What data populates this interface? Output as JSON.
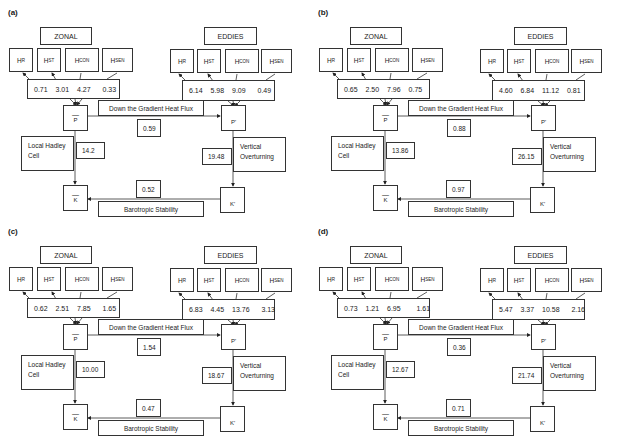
{
  "labels": {
    "zonal": "ZONAL",
    "eddies": "EDDIES",
    "h": "H",
    "h_subscripts": [
      "R",
      "ST",
      "CON",
      "SEN"
    ],
    "p_bar": "P",
    "k_bar": "K",
    "p_prime": "P'",
    "k_prime": "K'",
    "bar": "—",
    "gradient_flux": "Down the Gradient Heat Flux",
    "hadley_line1": "Local Hadley",
    "hadley_line2": "Cell",
    "vertical_line1": "Vertical",
    "vertical_line2": "Overturning",
    "barotropic": "Barotropic Stability"
  },
  "panels": [
    {
      "id": "(a)",
      "zonal_values": "0.71  3.01  4.27   0.33",
      "eddy_values": "6.14  5.98  9.09   0.49",
      "gradient_flux": "0.59",
      "hadley": "14.2",
      "vertical": "19.48",
      "barotropic": "0.52"
    },
    {
      "id": "(b)",
      "zonal_values": "0.65  2.50  7.96  0.75",
      "eddy_values": "4.60  6.84  11.12  0.81",
      "gradient_flux": "0.88",
      "hadley": "13.86",
      "vertical": "26.15",
      "barotropic": "0.97"
    },
    {
      "id": "(c)",
      "zonal_values": "0.62  2.51  7.85   1.65",
      "eddy_values": "6.83  4.45  13.76   3.13",
      "gradient_flux": "1.54",
      "hadley": "10.00",
      "vertical": "18.67",
      "barotropic": "0.47"
    },
    {
      "id": "(d)",
      "zonal_values": "0.73  1.21  6.95    1.61",
      "eddy_values": "5.47  3.37  10.58   2.16",
      "gradient_flux": "0.36",
      "hadley": "12.67",
      "vertical": "21.74",
      "barotropic": "0.71"
    }
  ],
  "colors": {
    "line": "#333333",
    "background": "#ffffff"
  }
}
